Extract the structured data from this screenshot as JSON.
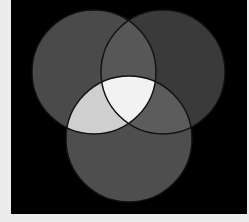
{
  "diagram": {
    "type": "three-circle-venn",
    "page_background": "#ececec",
    "panel": {
      "x": 11,
      "y": 0,
      "width": 236,
      "height": 214,
      "color": "#000000"
    },
    "circles": [
      {
        "id": "top-left",
        "cx": 94,
        "cy": 72,
        "r": 62,
        "fill": "#4a4a4a"
      },
      {
        "id": "top-right",
        "cx": 163,
        "cy": 72,
        "r": 62,
        "fill": "#3a3a3a"
      },
      {
        "id": "bottom",
        "cx": 129,
        "cy": 139,
        "r": 63,
        "fill": "#4e4e4e"
      }
    ],
    "regions": {
      "top_left_and_top_right": "#575757",
      "top_left_and_bottom": "#cfcfcf",
      "top_right_and_bottom": "#5c5c5c",
      "all_three": "#f2f2f2"
    },
    "outline_color": "#111111",
    "outline_width": 1.4
  }
}
